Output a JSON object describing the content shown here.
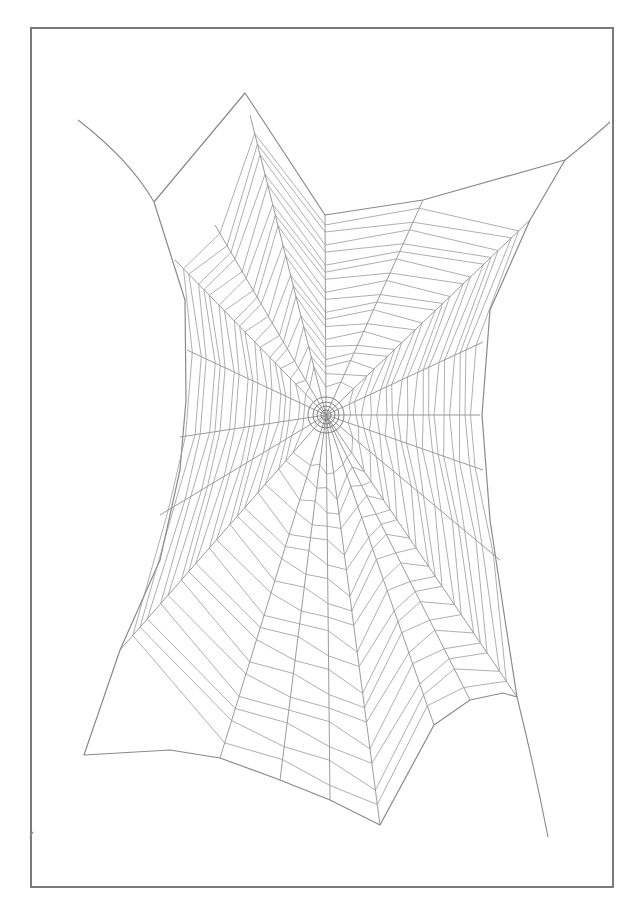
{
  "illustration": {
    "subject": "Spider web line drawing",
    "stroke_color": "#8a8a8a",
    "frame_color": "#7a7a7a",
    "background": "#ffffff",
    "hub": {
      "x": 326,
      "y": 415
    },
    "frame_polygon": [
      [
        154,
        202
      ],
      [
        245,
        93
      ],
      [
        325,
        215
      ],
      [
        423,
        200
      ],
      [
        565,
        160
      ],
      [
        530,
        220
      ],
      [
        490,
        310
      ],
      [
        482,
        415
      ],
      [
        490,
        520
      ],
      [
        505,
        620
      ],
      [
        517,
        697
      ],
      [
        503,
        693
      ],
      [
        470,
        700
      ],
      [
        434,
        725
      ],
      [
        380,
        825
      ],
      [
        330,
        800
      ],
      [
        280,
        780
      ],
      [
        220,
        758
      ],
      [
        170,
        750
      ],
      [
        84,
        755
      ],
      [
        120,
        650
      ],
      [
        160,
        560
      ],
      [
        180,
        470
      ],
      [
        186,
        400
      ],
      [
        185,
        300
      ]
    ],
    "anchor_lines": [
      {
        "from": [
          78,
          120
        ],
        "via": [
          130,
          160
        ],
        "to": [
          154,
          202
        ]
      },
      {
        "from": [
          610,
          122
        ],
        "via": [
          590,
          140
        ],
        "to": [
          565,
          160
        ]
      },
      {
        "from": [
          517,
          697
        ],
        "via": [
          535,
          770
        ],
        "to": [
          548,
          837
        ]
      },
      {
        "from": [
          33,
          832
        ],
        "via": [
          30,
          835
        ],
        "to": [
          30,
          838
        ]
      }
    ],
    "radial_endpoints": [
      [
        250,
        115
      ],
      [
        325,
        215
      ],
      [
        423,
        200
      ],
      [
        530,
        220
      ],
      [
        483,
        342
      ],
      [
        480,
        415
      ],
      [
        483,
        470
      ],
      [
        500,
        560
      ],
      [
        517,
        697
      ],
      [
        470,
        700
      ],
      [
        434,
        725
      ],
      [
        380,
        825
      ],
      [
        330,
        800
      ],
      [
        280,
        780
      ],
      [
        220,
        758
      ],
      [
        120,
        650
      ],
      [
        160,
        515
      ],
      [
        180,
        437
      ],
      [
        187,
        350
      ],
      [
        175,
        260
      ],
      [
        215,
        225
      ]
    ],
    "spiral_ring_count": 18
  }
}
